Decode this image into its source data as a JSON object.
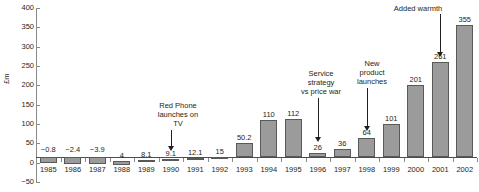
{
  "chart_data": {
    "type": "bar",
    "title": "",
    "xlabel": "",
    "ylabel": "£m",
    "ylim": [
      -50,
      400
    ],
    "ytick_step": 50,
    "grid": false,
    "legend": "none",
    "categories": [
      "1985",
      "1986",
      "1987",
      "1988",
      "1989",
      "1990",
      "1991",
      "1992",
      "1993",
      "1994",
      "1995",
      "1996",
      "1997",
      "1998",
      "1999",
      "2000",
      "2001",
      "2002"
    ],
    "values": [
      -0.8,
      -2.4,
      -3.9,
      4,
      8.1,
      9.1,
      12.1,
      15,
      50.2,
      110,
      112,
      26,
      36,
      64,
      101,
      201,
      261,
      355
    ],
    "value_labels": [
      "−0.8",
      "−2.4",
      "−3.9",
      "4",
      "8.1",
      "9.1",
      "12.1",
      "15",
      "50.2",
      "110",
      "112",
      "26",
      "36",
      "64",
      "101",
      "201",
      "261",
      "355"
    ],
    "ytick_labels": [
      "400",
      "350",
      "300",
      "250",
      "200",
      "150",
      "100",
      "50",
      "0",
      "−50"
    ],
    "ytick_values": [
      400,
      350,
      300,
      250,
      200,
      150,
      100,
      50,
      0,
      -50
    ],
    "annotations": [
      {
        "text": "Red Phone\nlaunches on\nTV",
        "target_category": "1990"
      },
      {
        "text": "Service\nstrategy\nvs price war",
        "target_category": "1996"
      },
      {
        "text": "New\nproduct\nlaunches",
        "target_category": "1998"
      },
      {
        "text": "Added warmth",
        "target_category": "2001"
      }
    ],
    "colors": {
      "bar_fill": "#9b9b9b",
      "bar_stroke": "#595959",
      "axis": "#8a8a8a",
      "text": "#231f20",
      "background": "#ffffff"
    }
  }
}
